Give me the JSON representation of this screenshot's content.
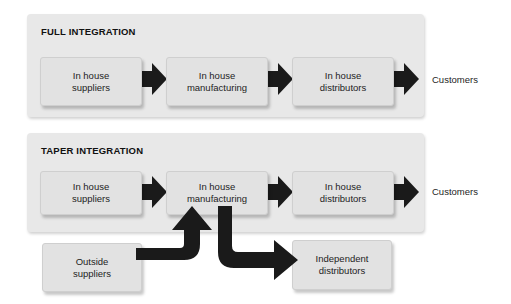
{
  "diagram": {
    "title_hidden": "",
    "background_color": "#ffffff",
    "panel_color": "#e8e8e8",
    "box_color": "#e2e2e2",
    "arrow_color": "#1a1a1a",
    "text_color": "#1d1d1d"
  },
  "panels": [
    {
      "id": "full-integration",
      "title": "FULL INTEGRATION",
      "nodes": [
        {
          "id": "in-house-suppliers",
          "line1": "In house",
          "line2": "suppliers"
        },
        {
          "id": "in-house-manufacturing",
          "line1": "In house",
          "line2": "manufacturing"
        },
        {
          "id": "in-house-distributors",
          "line1": "In house",
          "line2": "distributors"
        }
      ],
      "end_label": "Customers"
    },
    {
      "id": "taper-integration",
      "title": "TAPER INTEGRATION",
      "nodes": [
        {
          "id": "in-house-suppliers",
          "line1": "In house",
          "line2": "suppliers"
        },
        {
          "id": "in-house-manufacturing",
          "line1": "In house",
          "line2": "manufacturing"
        },
        {
          "id": "in-house-distributors",
          "line1": "In house",
          "line2": "distributors"
        }
      ],
      "end_label": "Customers"
    }
  ],
  "external_nodes": [
    {
      "id": "outside-suppliers",
      "line1": "Outside",
      "line2": "suppliers"
    },
    {
      "id": "independent-distributors",
      "line1": "Independent",
      "line2": "distributors"
    }
  ]
}
